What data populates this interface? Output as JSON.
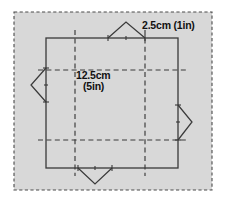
{
  "figure": {
    "background_color": "#ffffff",
    "panel_fill_color": "#d8d8d8",
    "panel_border_color": "#3a3a3a",
    "line_color": "#3a3a3a",
    "dashed_line_color": "#3a3a3a",
    "labels": {
      "edge_label": "2.5cm (1in)",
      "side_label_line1": "12.5cm",
      "side_label_line2": "(5in)"
    },
    "panel": {
      "x": 14,
      "y": 12,
      "width": 198,
      "height": 178
    },
    "square": {
      "x": 46,
      "y": 38,
      "width": 132,
      "height": 130
    },
    "grid": {
      "vertical_x": [
        75,
        145
      ],
      "horizontal_y": [
        70,
        140
      ],
      "overhang": 8
    },
    "flaps": [
      {
        "name": "top-flap",
        "direction": "up",
        "base_start": 108,
        "base_end": 145,
        "apex": 22
      },
      {
        "name": "left-flap",
        "direction": "left",
        "base_start": 68,
        "base_end": 102,
        "apex": 31
      },
      {
        "name": "right-flap",
        "direction": "right",
        "base_start": 105,
        "base_end": 140,
        "apex": 192
      },
      {
        "name": "bottom-flap",
        "direction": "down",
        "base_start": 78,
        "base_end": 112,
        "apex": 184
      }
    ],
    "ticks": [
      {
        "name": "tick-top-left",
        "x": 108,
        "y": 38
      },
      {
        "name": "tick-top-mid",
        "x": 126,
        "y": 38
      },
      {
        "name": "tick-top-right",
        "x": 145,
        "y": 38
      },
      {
        "name": "tick-left-upper",
        "x": 46,
        "y": 68
      },
      {
        "name": "tick-left-mid",
        "x": 46,
        "y": 85
      },
      {
        "name": "tick-left-lower",
        "x": 46,
        "y": 102
      },
      {
        "name": "tick-right-upper",
        "x": 178,
        "y": 105
      },
      {
        "name": "tick-right-mid",
        "x": 178,
        "y": 122
      },
      {
        "name": "tick-right-lower",
        "x": 178,
        "y": 140
      },
      {
        "name": "tick-bottom-left",
        "x": 78,
        "y": 168
      },
      {
        "name": "tick-bottom-mid",
        "x": 95,
        "y": 168
      },
      {
        "name": "tick-bottom-right",
        "x": 112,
        "y": 168
      }
    ]
  }
}
